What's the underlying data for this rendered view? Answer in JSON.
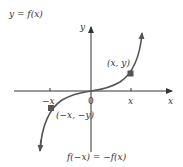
{
  "diagram": {
    "title": "y = f(x)",
    "y_axis_label": "y",
    "x_axis_label": "x",
    "origin_label": "0",
    "tick_pos_label": "x",
    "tick_neg_label": "−x",
    "point_pos_label": "(x, y)",
    "point_neg_label": "(−x, −y)",
    "caption": "f(−x) = −f(x)",
    "colors": {
      "axis": "#333333",
      "curve": "#555555",
      "point": "#555555",
      "text": "#333333"
    }
  }
}
